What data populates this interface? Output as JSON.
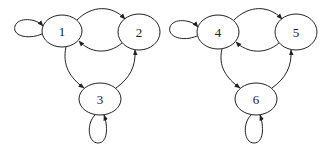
{
  "graphs": [
    {
      "name": "left-graph",
      "nodes": [
        {
          "id": "1",
          "label": "1",
          "cx": 62,
          "cy": 31,
          "rx": 20,
          "ry": 16
        },
        {
          "id": "2",
          "label": "2",
          "cx": 139,
          "cy": 32,
          "rx": 21,
          "ry": 18
        },
        {
          "id": "3",
          "label": "3",
          "cx": 100,
          "cy": 99,
          "rx": 21,
          "ry": 16
        }
      ],
      "edges": [
        {
          "from": "1",
          "to": "1",
          "d": "M 42 34 C 28 40, 12 36, 15 26 C 18 17, 36 18, 43 26"
        },
        {
          "from": "1",
          "to": "2",
          "d": "M 77 20 C 92 5, 112 5, 125 19"
        },
        {
          "from": "2",
          "to": "1",
          "d": "M 122 43 C 108 55, 90 53, 79 41"
        },
        {
          "from": "1",
          "to": "3",
          "d": "M 66 47 C 62 65, 70 78, 84 88"
        },
        {
          "from": "3",
          "to": "2",
          "d": "M 116 88 C 130 78, 136 66, 135 50"
        },
        {
          "from": "3",
          "to": "3",
          "d": "M 95 115 C 86 124, 88 143, 98 143 C 108 143, 108 126, 104 115"
        }
      ]
    },
    {
      "name": "right-graph",
      "nodes": [
        {
          "id": "4",
          "label": "4",
          "cx": 218,
          "cy": 32,
          "rx": 21,
          "ry": 17
        },
        {
          "id": "5",
          "label": "5",
          "cx": 296,
          "cy": 32,
          "rx": 21,
          "ry": 18
        },
        {
          "id": "6",
          "label": "6",
          "cx": 256,
          "cy": 99,
          "rx": 21,
          "ry": 16
        }
      ],
      "edges": [
        {
          "from": "4",
          "to": "4",
          "d": "M 197 36 C 183 42, 167 37, 170 27 C 173 18, 191 19, 198 27"
        },
        {
          "from": "4",
          "to": "5",
          "d": "M 234 20 C 249 5, 269 5, 282 19"
        },
        {
          "from": "5",
          "to": "4",
          "d": "M 279 43 C 265 55, 247 53, 236 42"
        },
        {
          "from": "4",
          "to": "6",
          "d": "M 222 49 C 218 66, 226 78, 240 88"
        },
        {
          "from": "6",
          "to": "5",
          "d": "M 272 88 C 286 78, 292 66, 291 50"
        },
        {
          "from": "6",
          "to": "6",
          "d": "M 251 115 C 242 124, 244 143, 254 143 C 264 143, 264 126, 260 115"
        }
      ]
    }
  ],
  "colors": {
    "stroke": "#222222",
    "background": "#ffffff"
  }
}
